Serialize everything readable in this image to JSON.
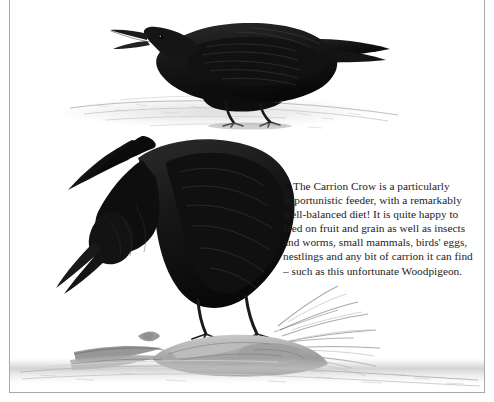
{
  "page": {
    "background_color": "#ffffff",
    "frame_color": "#a8a8a8"
  },
  "caption": {
    "marker_glyph": "◀",
    "marker_name": "left-pointing-triangle",
    "text": "The Carrion Crow is a particularly opportunistic feeder, with a remarkably well-balanced diet! It is quite happy to feed on fruit and grain as well as insects and worms, small mammals, birds' eggs, nestlings and any bit of carrion it can find – such as this unfortunate Woodpigeon.",
    "text_color": "#1d1d1d"
  },
  "illustration": {
    "subject": "Carrion Crow",
    "medium": "graphite pencil drawing",
    "ink_color": "#1a1a1a",
    "shadow_color": "#9a9a9a",
    "ground_color": "#c9c9c9",
    "figures": [
      {
        "name": "upper-crow",
        "description": "Carrion Crow standing in profile facing left with open beak, calling",
        "position": "top-left-of-centre"
      },
      {
        "name": "lower-crow",
        "description": "Carrion Crow bending forward, head down, feeding on carrion",
        "position": "centre-left"
      },
      {
        "name": "woodpigeon-carcass",
        "description": "Remains of a Woodpigeon with scattered feathers on the ground",
        "position": "bottom-centre"
      }
    ]
  }
}
